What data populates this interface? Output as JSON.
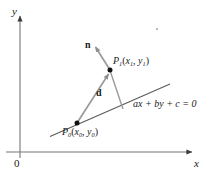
{
  "figure": {
    "background_color": "#ffffff",
    "axes": {
      "x_label": "x",
      "y_label": "y",
      "origin_label": "0",
      "axis_color": "#555555",
      "y_axis": {
        "x": 20,
        "top": 14,
        "bottom": 158
      },
      "x_axis": {
        "y": 152,
        "left": 6,
        "right": 196
      }
    },
    "line": {
      "equation_label": "ax + by + c = 0",
      "color": "#555555",
      "from": {
        "x": 50,
        "y": 136
      },
      "to": {
        "x": 170,
        "y": 84
      }
    },
    "points": [
      {
        "name": "P1",
        "label_base": "P",
        "label_sub": "1",
        "label_coords_x": "x",
        "label_coords_x_sub": "1",
        "label_coords_y": "y",
        "label_coords_y_sub": "1",
        "full_label": "P1(x1, y1)",
        "x": 110,
        "y": 70,
        "dot_color": "#111111"
      },
      {
        "name": "P0",
        "label_base": "P",
        "label_sub": "0",
        "label_coords_x": "x",
        "label_coords_x_sub": "0",
        "label_coords_y": "y",
        "label_coords_y_sub": "0",
        "full_label": "P0(x0, y0)",
        "x": 77,
        "y": 123,
        "dot_color": "#111111"
      }
    ],
    "vectors": [
      {
        "name": "n",
        "label": "n",
        "description": "normal vector from P1 pointing up-left",
        "from": {
          "x": 110,
          "y": 70
        },
        "to": {
          "x": 94,
          "y": 45
        },
        "color": "#8f8f8f"
      },
      {
        "name": "d",
        "label": "d",
        "description": "displacement vector from P0 to P1",
        "from": {
          "x": 77,
          "y": 123
        },
        "to": {
          "x": 110,
          "y": 70
        },
        "color": "#8f8f8f"
      }
    ],
    "perpendicular_segment": {
      "name": "distance-drop",
      "description": "segment from P1 perpendicular down to the line",
      "from": {
        "x": 110,
        "y": 70
      },
      "to": {
        "x": 123,
        "y": 109
      },
      "color": "#8f8f8f"
    }
  }
}
